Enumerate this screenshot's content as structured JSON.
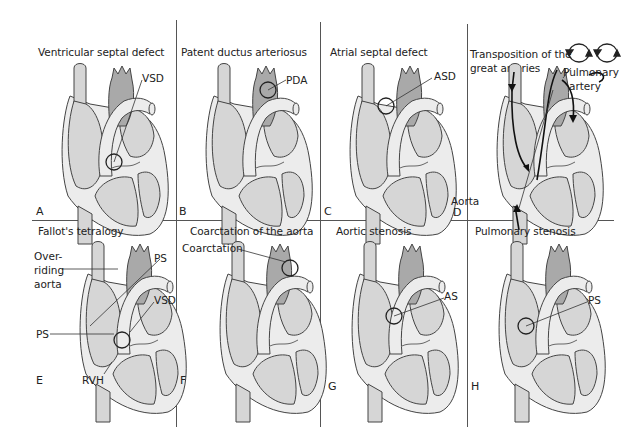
{
  "colors": {
    "chamber_fill": "#d6d6d6",
    "wall_fill": "#ececec",
    "aorta_fill": "#a9a9a9",
    "outline": "#444444",
    "grid_line": "#555555"
  },
  "panels": [
    {
      "letter": "A",
      "title": "Ventricular septal defect",
      "labels": [
        "VSD"
      ]
    },
    {
      "letter": "B",
      "title": "Patent ductus arteriosus",
      "labels": [
        "PDA"
      ]
    },
    {
      "letter": "C",
      "title": "Atrial septal defect",
      "labels": [
        "ASD"
      ]
    },
    {
      "letter": "D",
      "title_line1": "Transposition of the",
      "title_line2": "great arteries",
      "labels": [
        "Pulmonary",
        "artery",
        "Aorta"
      ]
    },
    {
      "letter": "E",
      "title": "Fallot's tetralogy",
      "labels": [
        "Over-",
        "riding",
        "aorta",
        "PS",
        "VSD",
        "PS",
        "RVH"
      ]
    },
    {
      "letter": "F",
      "title": "Coarctation of the aorta",
      "labels": [
        "Coarctation"
      ]
    },
    {
      "letter": "G",
      "title": "Aortic stenosis",
      "labels": [
        "AS"
      ]
    },
    {
      "letter": "H",
      "title": "Pulmonary stenosis",
      "labels": [
        "PS"
      ]
    }
  ]
}
